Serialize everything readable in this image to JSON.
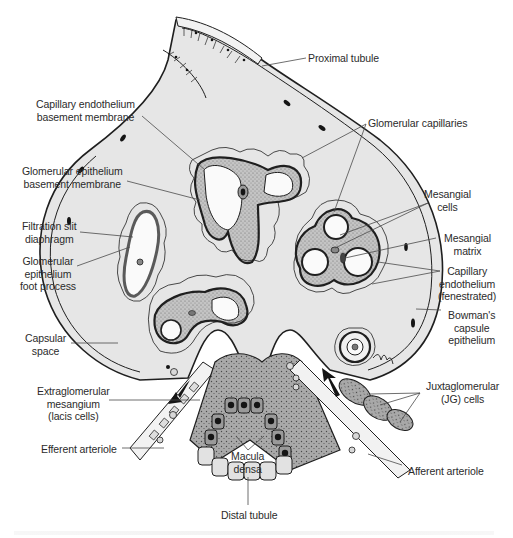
{
  "figure": {
    "colors": {
      "capsular_space": "#e6e6e6",
      "outline": "#1f1f1f",
      "capillary_wall": "#6e6e6e",
      "mesangium": "#bdbdbd",
      "macula_densa_cell": "#9a9a9a",
      "nucleus": "#151515",
      "label_text": "#2b2b2b",
      "leader_line": "#4a4a4a",
      "background": "#ffffff"
    }
  },
  "labels": {
    "proximal_tubule": "Proximal tubule",
    "capillary_endothelium_bm": "Capillary endothelium\nbasement membrane",
    "glomerular_capillaries": "Glomerular capillaries",
    "glomerular_epithelium_bm": "Glomerular epithelium\nbasement membrane",
    "mesangial_cells": "Mesangial\ncells",
    "mesangial_matrix": "Mesangial\nmatrix",
    "filtration_slit": "Filtration slit\ndiaphragm",
    "foot_process": "Glomerular\nepithelium\nfoot process",
    "capillary_endothelium_fen": "Capillary\nendothelium\n(fenestrated)",
    "bowmans_capsule": "Bowman's\ncapsule\nepithelium",
    "capsular_space": "Capsular\nspace",
    "extraglomerular_mesangium": "Extraglomerular\nmesangium\n(lacis cells)",
    "jg_cells": "Juxtaglomerular\n(JG) cells",
    "efferent_arteriole": "Efferent arteriole",
    "macula_densa": "Macula\ndensa",
    "afferent_arteriole": "Afferent arteriole",
    "distal_tubule": "Distal tubule"
  }
}
